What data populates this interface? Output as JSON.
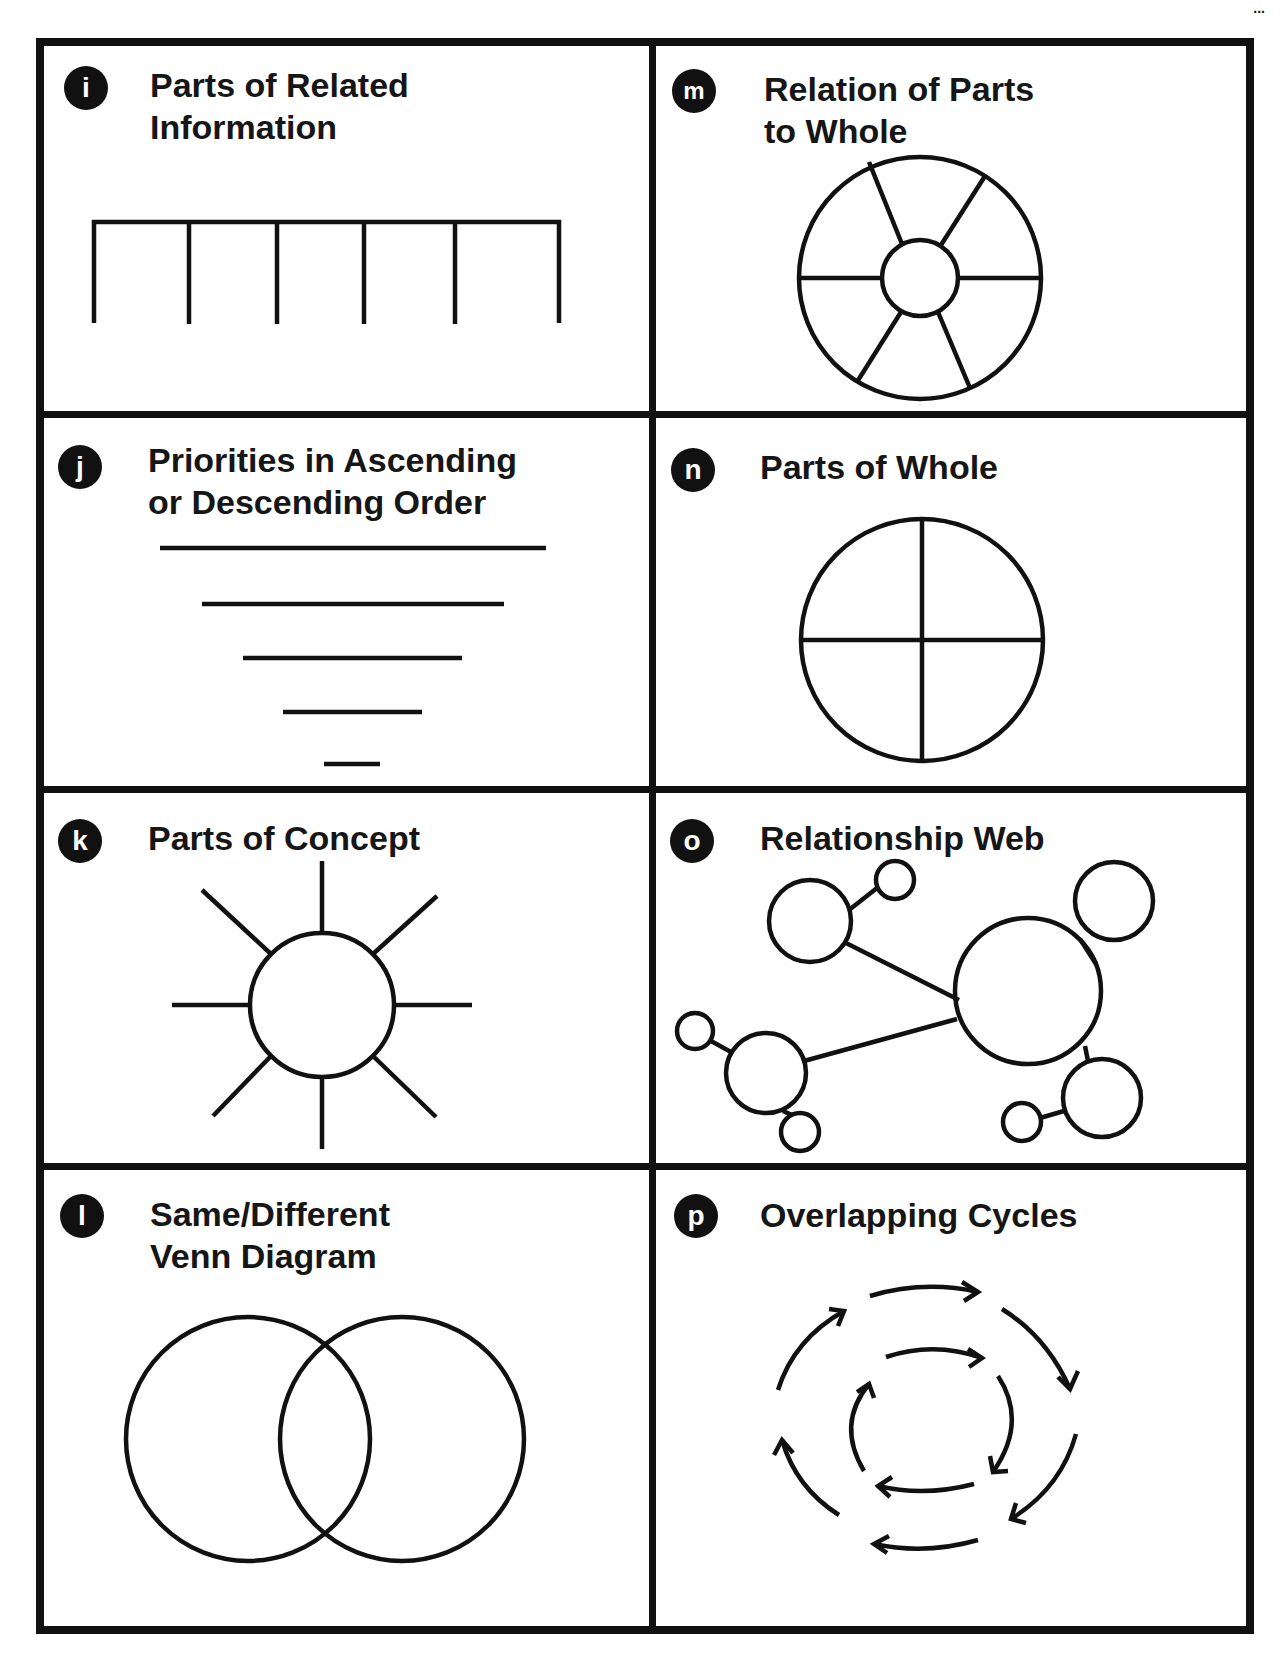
{
  "page": {
    "corner_mark": "..."
  },
  "organizers": [
    {
      "id": "i",
      "badge": "i",
      "title": "Parts of Related\nInformation",
      "diagram": "comb-brackets"
    },
    {
      "id": "m",
      "badge": "m",
      "title": "Relation of Parts\nto Whole",
      "diagram": "wheel-with-hub"
    },
    {
      "id": "j",
      "badge": "j",
      "title": "Priorities in Ascending\nor Descending Order",
      "diagram": "descending-lines"
    },
    {
      "id": "n",
      "badge": "n",
      "title": "Parts of Whole",
      "diagram": "quartered-circle"
    },
    {
      "id": "k",
      "badge": "k",
      "title": "Parts of Concept",
      "diagram": "sun-rays"
    },
    {
      "id": "o",
      "badge": "o",
      "title": "Relationship Web",
      "diagram": "bubble-web"
    },
    {
      "id": "l",
      "badge": "l",
      "title": "Same/Different\nVenn Diagram",
      "diagram": "venn-two-circles"
    },
    {
      "id": "p",
      "badge": "p",
      "title": "Overlapping Cycles",
      "diagram": "concentric-arrow-cycles"
    }
  ],
  "colors": {
    "ink": "#111111",
    "paper": "#ffffff"
  }
}
